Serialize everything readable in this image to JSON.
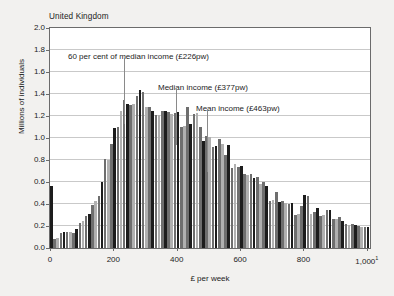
{
  "chart_data": {
    "type": "bar",
    "title": "United Kingdom",
    "xlabel": "£ per week",
    "ylabel": "Millions of individuals",
    "xlim": [
      0,
      1010
    ],
    "ylim": [
      0,
      2.0
    ],
    "grid": true,
    "legend": null,
    "bin_width": 10,
    "x_tick_labels": [
      "0",
      "200",
      "400",
      "600",
      "800",
      "1,000"
    ],
    "x_tick_values": [
      0,
      200,
      400,
      600,
      800,
      1000
    ],
    "x_last_tick_footnote": "1",
    "y_tick_labels": [
      "0.0",
      "0.2",
      "0.4",
      "0.6",
      "0.8",
      "1.0",
      "1.2",
      "1.4",
      "1.6",
      "1.8",
      "2.0"
    ],
    "y_tick_values": [
      0.0,
      0.2,
      0.4,
      0.6,
      0.8,
      1.0,
      1.2,
      1.4,
      1.6,
      1.8,
      2.0
    ],
    "x": [
      5,
      15,
      25,
      35,
      45,
      55,
      65,
      75,
      85,
      95,
      105,
      115,
      125,
      135,
      145,
      155,
      165,
      175,
      185,
      195,
      205,
      215,
      225,
      235,
      245,
      255,
      265,
      275,
      285,
      295,
      305,
      315,
      325,
      335,
      345,
      355,
      365,
      375,
      385,
      395,
      405,
      415,
      425,
      435,
      445,
      455,
      465,
      475,
      485,
      495,
      505,
      515,
      525,
      535,
      545,
      555,
      565,
      575,
      585,
      595,
      605,
      615,
      625,
      635,
      645,
      655,
      665,
      675,
      685,
      695,
      705,
      715,
      725,
      735,
      745,
      755,
      765,
      775,
      785,
      795,
      805,
      815,
      825,
      835,
      845,
      855,
      865,
      875,
      885,
      895,
      905,
      915,
      925,
      935,
      945,
      955,
      965,
      975,
      985,
      995
    ],
    "values": [
      0.56,
      0.08,
      0.09,
      0.14,
      0.15,
      0.15,
      0.15,
      0.14,
      0.17,
      0.23,
      0.25,
      0.29,
      0.31,
      0.39,
      0.43,
      0.47,
      0.6,
      0.81,
      0.8,
      0.95,
      1.09,
      1.1,
      1.25,
      1.35,
      1.31,
      1.3,
      1.31,
      1.38,
      1.44,
      1.42,
      1.28,
      1.28,
      1.25,
      1.21,
      1.21,
      1.25,
      1.25,
      1.24,
      1.22,
      1.23,
      1.24,
      1.1,
      1.11,
      1.28,
      1.13,
      1.22,
      1.23,
      1.1,
      0.97,
      1.02,
      1.01,
      0.92,
      0.93,
      0.99,
      0.95,
      0.85,
      0.94,
      0.73,
      0.76,
      0.74,
      0.75,
      0.67,
      0.66,
      0.67,
      0.64,
      0.65,
      0.58,
      0.6,
      0.56,
      0.43,
      0.44,
      0.51,
      0.42,
      0.43,
      0.41,
      0.4,
      0.41,
      0.3,
      0.31,
      0.38,
      0.48,
      0.47,
      0.31,
      0.33,
      0.36,
      0.29,
      0.3,
      0.35,
      0.35,
      0.26,
      0.26,
      0.28,
      0.25,
      0.22,
      0.21,
      0.22,
      0.21,
      0.2,
      0.19,
      0.19
    ],
    "tail_x": [
      1005,
      1015
    ],
    "tail_values": [
      0.19,
      0.18
    ],
    "series_note": "Alternating dark/light bar shading by bin",
    "bar_colors": {
      "dark": "#1c1c1c",
      "mid": "#6e6e6e",
      "light": "#b0b0b0"
    },
    "annotations": [
      {
        "name": "sixty-percent-median",
        "label": "60 per cent of median income (£226pw)",
        "value": 226,
        "label_x_px": 68,
        "label_y_px": 52,
        "line_x_px": 124,
        "line_top_px": 58,
        "line_bottom_px": 124
      },
      {
        "name": "median-income",
        "label": "Median income (£377pw)",
        "value": 377,
        "label_x_px": 158,
        "label_y_px": 83,
        "line_x_px": 176,
        "line_top_px": 89,
        "line_bottom_px": 145
      },
      {
        "name": "mean-income",
        "label": "Mean income (£463pw)",
        "value": 463,
        "label_x_px": 196,
        "label_y_px": 104,
        "line_x_px": 207,
        "line_top_px": 110,
        "line_bottom_px": 172
      }
    ]
  }
}
